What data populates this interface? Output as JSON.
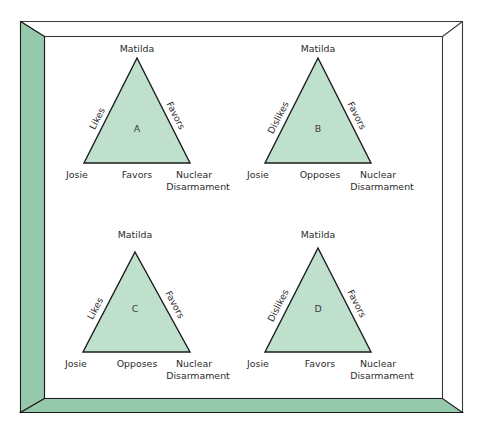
{
  "figure": {
    "name": "balance-theory-triangle-figure",
    "frame": {
      "left_wall_color": "#96c8ab",
      "bottom_wall_color": "#96c8ab",
      "panel_color": "#ffffff",
      "line_color": "#3a3a3a"
    },
    "triangle_style": {
      "fill": "#bfe0cd",
      "stroke": "#1c1c1c",
      "text_color": "#2b2b2b"
    }
  },
  "triangles": [
    {
      "id": "A",
      "apex_label": "Matilda",
      "left_side_label": "Likes",
      "right_side_label": "Favors",
      "bottom_left_label": "Josie",
      "bottom_center_label": "Favors",
      "bottom_right_label_line1": "Nuclear",
      "bottom_right_label_line2": "Disarmament"
    },
    {
      "id": "B",
      "apex_label": "Matilda",
      "left_side_label": "Dislikes",
      "right_side_label": "Favors",
      "bottom_left_label": "Josie",
      "bottom_center_label": "Opposes",
      "bottom_right_label_line1": "Nuclear",
      "bottom_right_label_line2": "Disarmament"
    },
    {
      "id": "C",
      "apex_label": "Matilda",
      "left_side_label": "Likes",
      "right_side_label": "Favors",
      "bottom_left_label": "Josie",
      "bottom_center_label": "Opposes",
      "bottom_right_label_line1": "Nuclear",
      "bottom_right_label_line2": "Disarmament"
    },
    {
      "id": "D",
      "apex_label": "Matilda",
      "left_side_label": "Dislikes",
      "right_side_label": "Favors",
      "bottom_left_label": "Josie",
      "bottom_center_label": "Favors",
      "bottom_right_label_line1": "Nuclear",
      "bottom_right_label_line2": "Disarmament"
    }
  ]
}
